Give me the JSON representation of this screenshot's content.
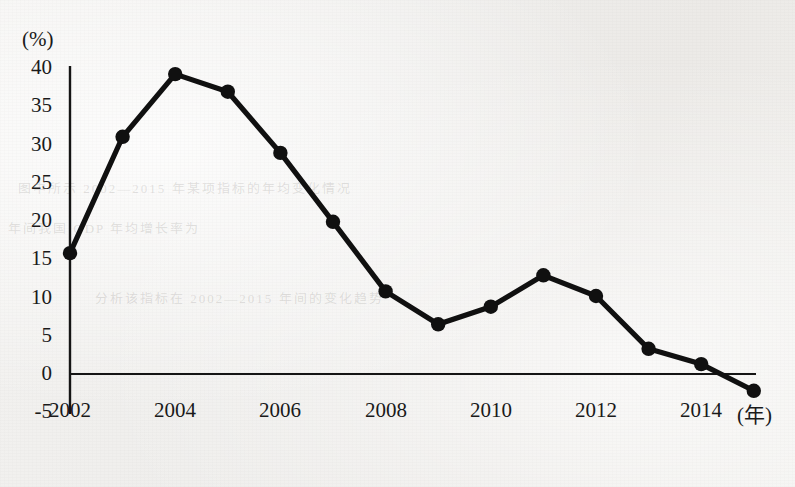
{
  "figure": {
    "y_axis_unit_label": "(%)",
    "x_axis_unit_label": "(年)"
  },
  "bleed_through_text": {
    "line1": "年间我国 GDP 年均增长率为",
    "line2": "图中所示 2002—2015 年某项指标的年均变化情况",
    "line3": "分析该指标在 2002—2015 年间的变化趋势"
  },
  "chart_data": {
    "type": "line",
    "title": "",
    "xlabel": "(年)",
    "ylabel": "(%)",
    "xlim": [
      2002,
      2015
    ],
    "ylim": [
      -5,
      40
    ],
    "yticks": [
      40,
      35,
      30,
      25,
      20,
      15,
      10,
      5,
      0,
      -5
    ],
    "ytick_labels": [
      "40",
      "35",
      "30",
      "25",
      "20",
      "15",
      "10",
      "5",
      "0",
      "-5"
    ],
    "xticks": [
      2002,
      2004,
      2006,
      2008,
      2010,
      2012,
      2014
    ],
    "xtick_labels": [
      "2002",
      "2004",
      "2006",
      "2008",
      "2010",
      "2012",
      "2014"
    ],
    "grid": false,
    "legend": false,
    "marker": "filled-circle",
    "line_color": "#101010",
    "x": [
      2002,
      2003,
      2004,
      2005,
      2006,
      2007,
      2008,
      2009,
      2010,
      2011,
      2012,
      2013,
      2014,
      2015
    ],
    "values": [
      15.8,
      31.0,
      39.2,
      36.9,
      28.9,
      19.9,
      10.8,
      6.5,
      8.8,
      12.9,
      10.2,
      3.3,
      1.3,
      -2.2
    ],
    "series": [
      {
        "name": "年均变化率",
        "values": [
          15.8,
          31.0,
          39.2,
          36.9,
          28.9,
          19.9,
          10.8,
          6.5,
          8.8,
          12.9,
          10.2,
          3.3,
          1.3,
          -2.2
        ]
      }
    ]
  }
}
